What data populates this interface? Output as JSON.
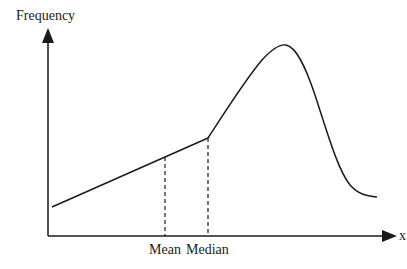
{
  "diagram": {
    "y_axis_label": "Frequency",
    "x_axis_label": "x",
    "markers": [
      {
        "label": "Mean",
        "x": 165
      },
      {
        "label": "Median",
        "x": 208
      }
    ],
    "colors": {
      "stroke": "#1a1a1a",
      "background": "#ffffff"
    }
  }
}
